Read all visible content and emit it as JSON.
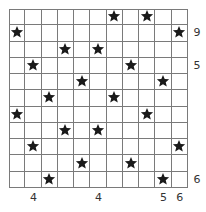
{
  "puzzle": {
    "rows": 11,
    "cols": 11,
    "star_color": "#1a1a1a",
    "grid_color": "#7a7a7a",
    "stars": [
      [
        0,
        6
      ],
      [
        0,
        8
      ],
      [
        1,
        0
      ],
      [
        1,
        10
      ],
      [
        2,
        3
      ],
      [
        2,
        5
      ],
      [
        3,
        1
      ],
      [
        3,
        7
      ],
      [
        4,
        4
      ],
      [
        4,
        9
      ],
      [
        5,
        2
      ],
      [
        5,
        6
      ],
      [
        6,
        0
      ],
      [
        6,
        8
      ],
      [
        7,
        3
      ],
      [
        7,
        5
      ],
      [
        8,
        1
      ],
      [
        8,
        10
      ],
      [
        9,
        4
      ],
      [
        9,
        7
      ],
      [
        10,
        2
      ],
      [
        10,
        9
      ]
    ],
    "right_clues": [
      {
        "row": 1,
        "value": "9"
      },
      {
        "row": 3,
        "value": "5"
      },
      {
        "row": 10,
        "value": "6"
      }
    ],
    "bottom_clues": [
      {
        "col": 1,
        "value": "4"
      },
      {
        "col": 5,
        "value": "4"
      },
      {
        "col": 9,
        "value": "5"
      },
      {
        "col": 10,
        "value": "6"
      }
    ]
  }
}
